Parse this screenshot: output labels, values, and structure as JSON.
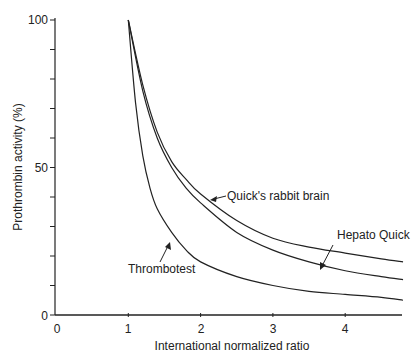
{
  "chart_data": {
    "type": "line",
    "title": "",
    "xlabel": "International normalized ratio",
    "ylabel": "Prothrombin activity (%)",
    "xlim": [
      0,
      4.8
    ],
    "ylim": [
      0,
      100
    ],
    "x_ticks": [
      "0",
      "1",
      "2",
      "3",
      "4"
    ],
    "y_ticks": [
      "0",
      "50",
      "100"
    ],
    "y_minor_ticks": [
      10,
      20,
      30,
      40,
      60,
      70,
      80,
      90
    ],
    "grid": false,
    "legend": "inline annotations with arrows",
    "series": [
      {
        "name": "Quick's rabbit brain",
        "x": [
          1.0,
          1.2,
          1.4,
          1.6,
          1.8,
          2.0,
          2.5,
          3.0,
          3.5,
          4.0,
          4.5,
          4.8
        ],
        "values": [
          100,
          78,
          62,
          52,
          46,
          41,
          32,
          26,
          23,
          21,
          19,
          18
        ]
      },
      {
        "name": "Hepato Quick",
        "x": [
          1.0,
          1.2,
          1.4,
          1.6,
          1.8,
          2.0,
          2.5,
          3.0,
          3.5,
          4.0,
          4.5,
          4.8
        ],
        "values": [
          100,
          76,
          60,
          50,
          43,
          38,
          28,
          22,
          18,
          15,
          13,
          12
        ]
      },
      {
        "name": "Thrombotest",
        "x": [
          1.0,
          1.1,
          1.2,
          1.3,
          1.4,
          1.6,
          1.8,
          2.0,
          2.5,
          3.0,
          3.5,
          4.0,
          4.5,
          4.8
        ],
        "values": [
          100,
          72,
          54,
          43,
          36,
          28,
          22,
          18,
          13,
          10,
          8,
          7,
          6,
          5
        ]
      }
    ]
  },
  "labels": {
    "quick": "Quick's rabbit brain",
    "hepato": "Hepato Quick",
    "thrombo": "Thrombotest",
    "xlabel": "International normalized ratio",
    "ylabel": "Prothrombin activity (%)",
    "x0": "0",
    "x1": "1",
    "x2": "2",
    "x3": "3",
    "x4": "4",
    "y0": "0",
    "y50": "50",
    "y100": "100"
  }
}
